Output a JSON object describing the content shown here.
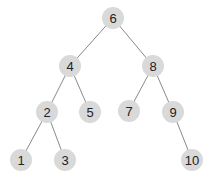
{
  "diagram": {
    "type": "binary-search-tree",
    "node_fill": "#d9d9d9",
    "edge_color": "#8a8a8a",
    "text_color": "#222222",
    "node_radius": 11,
    "nodes": [
      {
        "id": "n6",
        "label": "6",
        "x": 113,
        "y": 18
      },
      {
        "id": "n4",
        "label": "4",
        "x": 70,
        "y": 66
      },
      {
        "id": "n8",
        "label": "8",
        "x": 153,
        "y": 66
      },
      {
        "id": "n2",
        "label": "2",
        "x": 47,
        "y": 112
      },
      {
        "id": "n5",
        "label": "5",
        "x": 90,
        "y": 112
      },
      {
        "id": "n7",
        "label": "7",
        "x": 129,
        "y": 111
      },
      {
        "id": "n9",
        "label": "9",
        "x": 173,
        "y": 112
      },
      {
        "id": "n1",
        "label": "1",
        "x": 21,
        "y": 160
      },
      {
        "id": "n3",
        "label": "3",
        "x": 65,
        "y": 160
      },
      {
        "id": "n10",
        "label": "10",
        "x": 192,
        "y": 160
      }
    ],
    "edges": [
      {
        "from": "n6",
        "to": "n4"
      },
      {
        "from": "n6",
        "to": "n8"
      },
      {
        "from": "n4",
        "to": "n2"
      },
      {
        "from": "n4",
        "to": "n5"
      },
      {
        "from": "n8",
        "to": "n7"
      },
      {
        "from": "n8",
        "to": "n9"
      },
      {
        "from": "n2",
        "to": "n1"
      },
      {
        "from": "n2",
        "to": "n3"
      },
      {
        "from": "n9",
        "to": "n10"
      }
    ]
  }
}
